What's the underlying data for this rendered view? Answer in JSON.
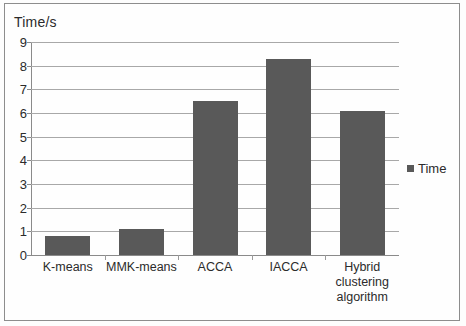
{
  "chart_data": {
    "type": "bar",
    "title": "",
    "ylabel": "Time/s",
    "xlabel": "",
    "categories": [
      "K-means",
      "MMK-means",
      "ACCA",
      "IACCA",
      "Hybrid clustering algorithm"
    ],
    "category_lines": [
      [
        "K-means"
      ],
      [
        "MMK-means"
      ],
      [
        "ACCA"
      ],
      [
        "IACCA"
      ],
      [
        "Hybrid",
        "clustering",
        "algorithm"
      ]
    ],
    "series": [
      {
        "name": "Time",
        "values": [
          0.8,
          1.1,
          6.5,
          8.3,
          6.1
        ]
      }
    ],
    "ylim": [
      0,
      9
    ],
    "ytick_labels": [
      "9",
      "8",
      "7",
      "6",
      "5",
      "4",
      "3",
      "2",
      "1",
      "0"
    ],
    "ytick_values": [
      9,
      8,
      7,
      6,
      5,
      4,
      3,
      2,
      1,
      0
    ],
    "grid": true,
    "legend": {
      "position": "right",
      "entries": [
        "Time"
      ]
    },
    "colors": {
      "bar": "#595959",
      "gridline": "#a8a8a8",
      "axis": "#8a8a8a",
      "text": "#2b2b2b",
      "background": "#fefefe",
      "frame": "#8d8d8d"
    }
  }
}
